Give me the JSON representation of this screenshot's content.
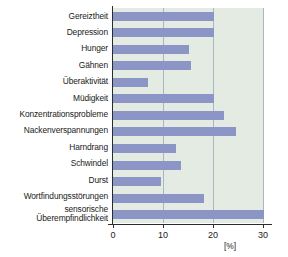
{
  "chart_data": {
    "type": "bar",
    "orientation": "horizontal",
    "title": "",
    "xlabel": "[%]",
    "ylabel": "",
    "xlim": [
      0,
      30
    ],
    "xticks": [
      "0",
      "10",
      "20",
      "30"
    ],
    "xtick_values": [
      0,
      10,
      20,
      30
    ],
    "grid": true,
    "legend": false,
    "categories": [
      "Gereiztheit",
      "Depression",
      "Hunger",
      "Gähnen",
      "Überaktivität",
      "Müdigkeit",
      "Konzentrationsprobleme",
      "Nackenverspannungen",
      "Harndrang",
      "Schwindel",
      "Durst",
      "Wortfindungsstörungen",
      "sensorische\nÜberempfindlichkeit"
    ],
    "values": [
      20,
      20,
      15,
      15.5,
      7,
      20,
      22,
      24.5,
      12.5,
      13.5,
      9.5,
      18,
      30.5
    ],
    "bar_color": "#8c96c6",
    "plot_background": "#e3ebe3",
    "gridline_color": "#a9b7c4",
    "axis_color": "#2c2c2c"
  }
}
